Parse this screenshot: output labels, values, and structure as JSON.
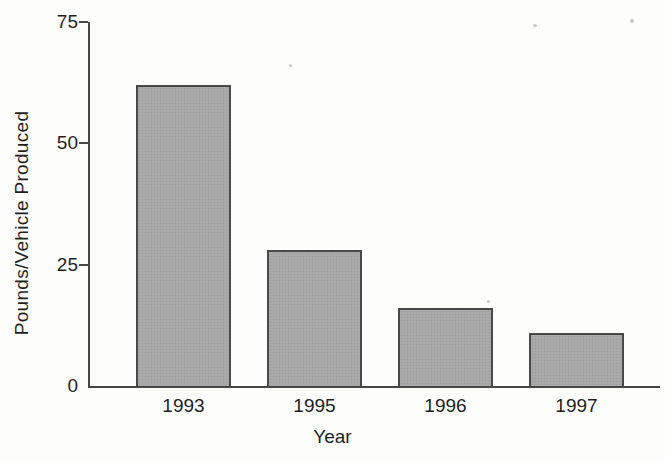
{
  "chart_data": {
    "type": "bar",
    "categories": [
      "1993",
      "1995",
      "1996",
      "1997"
    ],
    "values": [
      62,
      28,
      16,
      11
    ],
    "title": "",
    "xlabel": "Year",
    "ylabel": "Pounds/Vehicle Produced",
    "ylim": [
      0,
      75
    ],
    "yticks": [
      0,
      25,
      50,
      75
    ],
    "grid": false,
    "legend": null,
    "bar_color": "#a8a8a8",
    "bar_border_color": "#484848",
    "axis_color": "#474747",
    "text_color": "#1f1f1f",
    "background_color": "#fdfdfc"
  }
}
